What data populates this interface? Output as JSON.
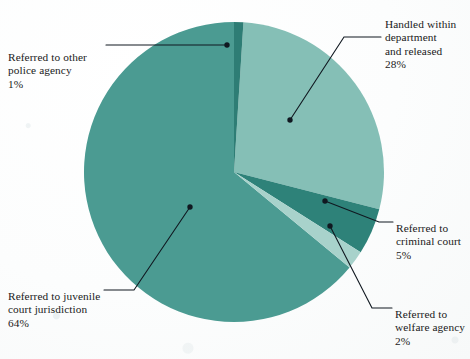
{
  "chart_data": {
    "type": "pie",
    "title": "",
    "subtitle": "",
    "xlabel": "",
    "ylabel": "",
    "legend_position": "callouts",
    "grid": false,
    "start_angle_deg": 0,
    "direction": "clockwise",
    "center": {
      "x": 234,
      "y": 172
    },
    "radius": 150,
    "categories": [
      "Referred to other police agency",
      "Handled within department and released",
      "Referred to criminal court",
      "Referred to welfare agency",
      "Referred to juvenile court jurisdiction"
    ],
    "values": [
      1,
      28,
      5,
      2,
      64
    ],
    "units": "%",
    "slices": [
      {
        "id": "other-police-agency",
        "label": "Referred to other\npolice agency",
        "value": 1,
        "value_label": "1%",
        "color": "#2e7d74",
        "start_deg": 0,
        "end_deg": 3.6
      },
      {
        "id": "handled-within-department",
        "label": "Handled within\ndepartment\nand released",
        "value": 28,
        "value_label": "28%",
        "color": "#85bfb6",
        "start_deg": 3.6,
        "end_deg": 104.4
      },
      {
        "id": "criminal-court",
        "label": "Referred to\ncriminal court",
        "value": 5,
        "value_label": "5%",
        "color": "#2e8279",
        "start_deg": 104.4,
        "end_deg": 122.4
      },
      {
        "id": "welfare-agency",
        "label": "Referred to\nwelfare agency",
        "value": 2,
        "value_label": "2%",
        "color": "#a8d2cb",
        "start_deg": 122.4,
        "end_deg": 129.6
      },
      {
        "id": "juvenile-court",
        "label": "Referred to juvenile\ncourt jurisdiction",
        "value": 64,
        "value_label": "64%",
        "color": "#4b9b92",
        "start_deg": 129.6,
        "end_deg": 360
      }
    ]
  },
  "callouts": {
    "handled": {
      "label": "Handled within\ndepartment\nand released",
      "value_label": "28%"
    },
    "other_police": {
      "label": "Referred to other\npolice agency",
      "value_label": "1%"
    },
    "criminal_court": {
      "label": "Referred to\ncriminal court",
      "value_label": "5%"
    },
    "welfare": {
      "label": "Referred to\nwelfare agency",
      "value_label": "2%"
    },
    "juvenile": {
      "label": "Referred to juvenile\ncourt jurisdiction",
      "value_label": "64%"
    }
  },
  "colors": {
    "slice_light": "#85bfb6",
    "slice_medium": "#4b9b92",
    "slice_dark": "#2e8279",
    "slice_pale": "#a8d2cb",
    "leader_line": "#101820",
    "text": "#1a1a1a",
    "background": "#fdfdfd"
  }
}
